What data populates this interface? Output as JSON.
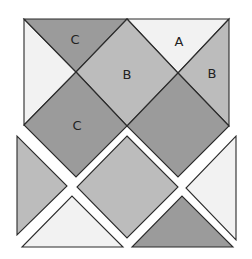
{
  "colors": {
    "white": "#f2f2f2",
    "light": "#bcbcbc",
    "dark": "#9b9b9b",
    "stroke": "#2b2b2b"
  },
  "labels": {
    "top_c": "C",
    "top_a": "A",
    "center_b": "B",
    "right_b": "B",
    "lower_c": "C"
  },
  "pieces": {
    "assembled": [
      {
        "id": "left-white-triangle",
        "points": "24,19 24,125 76,72",
        "fill": "white"
      },
      {
        "id": "top-c-triangle",
        "points": "24,19 127,19 76,72",
        "fill": "dark"
      },
      {
        "id": "top-a-triangle",
        "points": "127,19 229,19 178,73",
        "fill": "white"
      },
      {
        "id": "center-b-diamond",
        "points": "127,19 178,73 127,126 76,72",
        "fill": "light"
      },
      {
        "id": "right-b-triangle",
        "points": "229,19 229,126 178,73",
        "fill": "light"
      },
      {
        "id": "lower-c-diamond",
        "points": "76,72 127,126 76,177 24,125",
        "fill": "dark"
      },
      {
        "id": "lower-right-diamond",
        "points": "178,73 229,126 178,177 127,126",
        "fill": "dark"
      }
    ],
    "separated": [
      {
        "id": "sep-left-triangle",
        "points": "17,136 17,235 67,186",
        "fill": "light"
      },
      {
        "id": "sep-center-diamond",
        "points": "127,136 178,187 127,238 77,187",
        "fill": "light"
      },
      {
        "id": "sep-right-triangle",
        "points": "236,136 236,240 186,188",
        "fill": "white"
      },
      {
        "id": "sep-bottom-left-triangle",
        "points": "22,247 123,247 72,196",
        "fill": "white"
      },
      {
        "id": "sep-bottom-right-triangle",
        "points": "132,247 233,247 182,196",
        "fill": "dark"
      }
    ]
  }
}
